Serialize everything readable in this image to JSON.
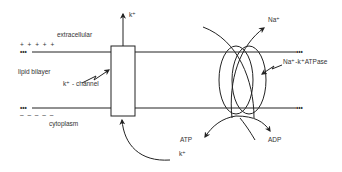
{
  "diagram": {
    "labels": {
      "extracellular": "extracellular",
      "lipid_bilayer": "lipid bilayer",
      "cytoplasm": "cytoplasm",
      "k_channel": "k⁺ - channel",
      "k_out": "k⁺",
      "k_in": "k⁺",
      "na_out": "Na⁺",
      "atpase": "Na⁺-k⁺ATPase",
      "atp": "ATP",
      "adp": "ADP",
      "plus_charges": "+ + + + +",
      "minus_charges": "– – – – –",
      "dots_top_left": "•••",
      "dots_top_right": "•••",
      "dots_bottom_left": "•••",
      "dots_bottom_right": "•••"
    },
    "colors": {
      "stroke": "#222222",
      "text": "#333333",
      "background": "#ffffff"
    }
  }
}
